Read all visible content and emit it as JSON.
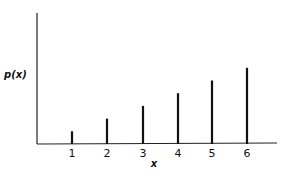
{
  "chart_data": {
    "type": "bar",
    "style": "stick/line plot (probability mass function)",
    "title": "",
    "xlabel": "x",
    "ylabel": "p(x)",
    "categories": [
      "1",
      "2",
      "3",
      "4",
      "5",
      "6"
    ],
    "x": [
      1,
      2,
      3,
      4,
      5,
      6
    ],
    "values": [
      0.048,
      0.095,
      0.143,
      0.19,
      0.238,
      0.286
    ],
    "relative_heights": [
      1,
      2,
      3,
      4,
      5,
      6
    ],
    "y_ticks": [],
    "grid": false,
    "legend": null,
    "colors": {
      "bars": "#111111",
      "axes": "#222222",
      "background": "#ffffff"
    }
  },
  "labels": {
    "ylabel": "p(x)",
    "xlabel": "x",
    "ticks": [
      "1",
      "2",
      "3",
      "4",
      "5",
      "6"
    ]
  }
}
